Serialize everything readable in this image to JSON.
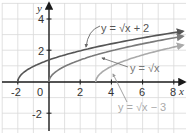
{
  "chart_data": {
    "type": "line",
    "title": "",
    "xlabel": "x",
    "ylabel": "y",
    "xlim": [
      -3,
      8.7
    ],
    "ylim": [
      -3.3,
      5
    ],
    "grid": true,
    "x_ticks": [
      "-2",
      "0",
      "2",
      "4",
      "6",
      "8"
    ],
    "y_ticks": [
      "4",
      "2",
      "-2"
    ],
    "series": [
      {
        "name": "y = √x + 2",
        "label": "y = √x + 2",
        "domain_start": -2,
        "color": "#555555",
        "points": [
          [
            -2,
            0
          ],
          [
            -1,
            1
          ],
          [
            0,
            1.414
          ],
          [
            2,
            2
          ],
          [
            4,
            2.449
          ],
          [
            6,
            2.828
          ],
          [
            8,
            3.162
          ]
        ]
      },
      {
        "name": "y = √x",
        "label": "y = √x",
        "domain_start": 0,
        "color": "#7a7a7a",
        "points": [
          [
            0,
            0
          ],
          [
            1,
            1
          ],
          [
            2,
            1.414
          ],
          [
            4,
            2
          ],
          [
            6,
            2.449
          ],
          [
            8,
            2.828
          ]
        ]
      },
      {
        "name": "y = √x − 3",
        "label": "y = √x − 3",
        "domain_start": 3,
        "color": "#aaaaaa",
        "points": [
          [
            3,
            0
          ],
          [
            4,
            1
          ],
          [
            5,
            1.414
          ],
          [
            7,
            2
          ],
          [
            8,
            2.236
          ]
        ]
      }
    ],
    "annotations": [
      "y = √x + 2",
      "y = √x",
      "y = √x − 3"
    ],
    "legend": "inline labels with arrows"
  }
}
